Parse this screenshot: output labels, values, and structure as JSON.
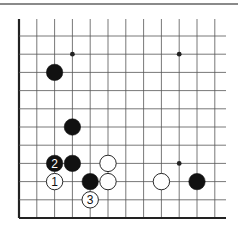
{
  "diagram": {
    "type": "go-board-fragment",
    "grid": {
      "origin_x": 19,
      "origin_y": 36,
      "col_spacing": 17.8,
      "row_spacing": 18.2,
      "columns": 12,
      "rows": 11,
      "top_y": 19,
      "right_x": 226,
      "bottom_y": 218,
      "edges": [
        "left",
        "bottom"
      ]
    },
    "colors": {
      "line": "#555555",
      "edge": "#222222",
      "black_stone": "#111111",
      "white_stone": "#ffffff",
      "rule": "#8a8a8a"
    },
    "star_points": [
      {
        "col": 3,
        "row": 1
      },
      {
        "col": 9,
        "row": 1
      },
      {
        "col": 9,
        "row": 7
      }
    ],
    "stones": [
      {
        "color": "black",
        "col": 2,
        "row": 2,
        "label": ""
      },
      {
        "color": "black",
        "col": 3,
        "row": 5,
        "label": ""
      },
      {
        "color": "black",
        "col": 2,
        "row": 7,
        "label": "2"
      },
      {
        "color": "black",
        "col": 3,
        "row": 7,
        "label": ""
      },
      {
        "color": "white",
        "col": 5,
        "row": 7,
        "label": ""
      },
      {
        "color": "white",
        "col": 2,
        "row": 8,
        "label": "1"
      },
      {
        "color": "black",
        "col": 4,
        "row": 8,
        "label": ""
      },
      {
        "color": "white",
        "col": 5,
        "row": 8,
        "label": ""
      },
      {
        "color": "white",
        "col": 8,
        "row": 8,
        "label": ""
      },
      {
        "color": "black",
        "col": 10,
        "row": 8,
        "label": ""
      },
      {
        "color": "white",
        "col": 4,
        "row": 9,
        "label": "3"
      }
    ]
  }
}
